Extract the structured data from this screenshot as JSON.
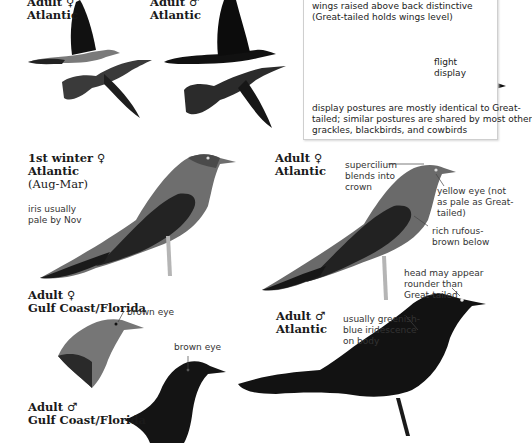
{
  "plate": {
    "flight_labels": [
      {
        "sex": "Adult ♀",
        "region": "Atlantic"
      },
      {
        "sex": "Adult ♂",
        "region": "Atlantic"
      }
    ],
    "display_box": {
      "caption_top": [
        "wings raised above back distinctive",
        "(Great-tailed holds wings level)"
      ],
      "flight_display_label": [
        "flight",
        "display"
      ],
      "caption_bottom": [
        "display postures are mostly identical to Great-",
        "tailed; similar postures are shared by most other",
        "grackles, blackbirds, and cowbirds"
      ]
    },
    "first_winter_female": {
      "title": "1st winter ♀",
      "region": "Atlantic",
      "season": "(Aug-Mar)",
      "note": [
        "iris usually",
        "pale by Nov"
      ]
    },
    "adult_female_atlantic": {
      "title": "Adult ♀",
      "region": "Atlantic",
      "notes": {
        "supercilium": [
          "supercilium",
          "blends into",
          "crown"
        ],
        "eye": [
          "yellow eye (not",
          "as pale as Great-",
          "tailed)"
        ],
        "belly": [
          "rich rufous-",
          "brown below"
        ]
      }
    },
    "adult_male_atlantic": {
      "title": "Adult ♂",
      "region": "Atlantic",
      "notes": {
        "head": [
          "head may appear",
          "rounder than",
          "Great-tailed"
        ],
        "body": [
          "usually greenish-",
          "blue iridescence",
          "on body"
        ]
      }
    },
    "adult_female_gulf": {
      "title": "Adult ♀",
      "region": "Gulf Coast/Florida",
      "note": "brown eye"
    },
    "adult_male_gulf": {
      "title": "Adult ♂",
      "region": "Gulf Coast/Florida",
      "note": "brown eye"
    }
  },
  "colors": {
    "male_black": "#121212",
    "female_body": "#6e6e6e",
    "female_wing": "#2a2a2a",
    "female_breast": "#8a8a8a",
    "box_border": "#cfcfcf"
  }
}
